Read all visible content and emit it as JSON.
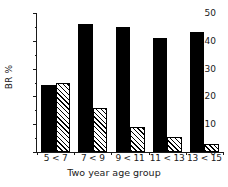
{
  "chart_data": {
    "type": "bar",
    "title": "",
    "xlabel": "Two year age group",
    "ylabel": "BR %",
    "categories": [
      "5 < 7",
      "7 < 9",
      "9 < 11",
      "11 < 13",
      "13 < 15"
    ],
    "series": [
      {
        "name": "solid",
        "fill": "solid-black",
        "values": [
          24,
          46,
          45,
          41,
          43
        ]
      },
      {
        "name": "hatched",
        "fill": "diagonal-hatch",
        "values": [
          25,
          16,
          9,
          5.5,
          3
        ]
      }
    ],
    "ylim": [
      0,
      50
    ],
    "y_major_ticks": [
      0,
      10,
      20,
      30,
      40,
      50
    ],
    "y_minor_ticks": [
      5,
      15,
      25,
      35,
      45
    ],
    "y_tick_labels": [
      "0",
      "10",
      "20",
      "30",
      "40",
      "50"
    ],
    "grid": false,
    "legend": "none",
    "colors": {
      "solid": "#000000",
      "hatch_line": "#000000",
      "hatch_bg": "#ffffff",
      "axis": "#1a1a1a"
    }
  }
}
